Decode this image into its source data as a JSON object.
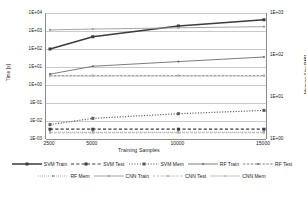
{
  "chart_data": {
    "type": "line",
    "title": "",
    "xlabel": "Training Samples",
    "ylabel": "Time [s]",
    "ylabel_secondary": "Memory Size [MB]",
    "categories": [
      "2500",
      "5000",
      "10000",
      "15000"
    ],
    "x_values": [
      2500,
      5000,
      10000,
      15000
    ],
    "y_axis_left": {
      "scale": "log",
      "ticks": [
        "1E+04",
        "1E+03",
        "1E+02",
        "1E+01",
        "1E+00",
        "1E-01",
        "1E-02",
        "1E-03"
      ],
      "tick_values": [
        10000,
        1000,
        100,
        10,
        1,
        0.1,
        0.01,
        0.001
      ],
      "ylim": [
        0.001,
        10000
      ],
      "unit": "s"
    },
    "y_axis_right": {
      "scale": "log",
      "ticks": [
        "1E+03",
        "1E+02",
        "1E+01",
        "1E+00"
      ],
      "tick_values": [
        1000,
        100,
        10,
        1
      ],
      "ylim": [
        1,
        1000
      ],
      "unit": "MB"
    },
    "grid": true,
    "legend_position": "bottom",
    "series": [
      {
        "name": "SVM Train",
        "axis": "left",
        "unit": "s",
        "values": [
          100,
          480,
          1900,
          4200
        ],
        "color": "#3b3b3b",
        "style": "solid",
        "width": 1.5,
        "marker": "square",
        "marker_size": 3.0
      },
      {
        "name": "SVM Test",
        "axis": "left",
        "unit": "s",
        "values": [
          0.0035,
          0.0035,
          0.0035,
          0.0035
        ],
        "color": "#3b3b3b",
        "style": "dashed",
        "width": 1.2,
        "marker": "square",
        "marker_size": 3.0
      },
      {
        "name": "SVM Mem",
        "axis": "right",
        "unit": "MB",
        "values": [
          2.2,
          3.1,
          4.0,
          4.8
        ],
        "color": "#5a5a5a",
        "style": "dotted",
        "width": 1.2,
        "marker": "square",
        "marker_size": 3.0
      },
      {
        "name": "RF Train",
        "axis": "left",
        "unit": "s",
        "values": [
          4.0,
          11.0,
          20.0,
          36.0
        ],
        "color": "#6e6e6e",
        "style": "solid",
        "width": 0.9,
        "marker": "circle",
        "marker_size": 2.2
      },
      {
        "name": "RF Test",
        "axis": "left",
        "unit": "s",
        "values": [
          3.3,
          3.3,
          3.3,
          3.3
        ],
        "color": "#6e6e6e",
        "style": "dashed",
        "width": 0.9,
        "marker": "circle",
        "marker_size": 2.2
      },
      {
        "name": "RF Mem",
        "axis": "right",
        "unit": "MB",
        "values": [
          1.45,
          1.45,
          1.45,
          1.45
        ],
        "color": "#8a8a8a",
        "style": "dotted",
        "width": 0.9,
        "marker": "circle",
        "marker_size": 2.2
      },
      {
        "name": "CNN Train",
        "axis": "left",
        "unit": "s",
        "values": [
          1150,
          1280,
          1500,
          1750
        ],
        "color": "#9a9a9a",
        "style": "solid",
        "width": 0.9,
        "marker": "circle",
        "marker_size": 2.2
      },
      {
        "name": "CNN Test",
        "axis": "left",
        "unit": "s",
        "values": [
          0.0022,
          0.0022,
          0.0022,
          0.0022
        ],
        "color": "#aeaeae",
        "style": "dashed",
        "width": 0.9,
        "marker": "circle",
        "marker_size": 2.2
      },
      {
        "name": "CNN Mem",
        "axis": "right",
        "unit": "MB",
        "values": [
          31.5,
          31.5,
          31.5,
          31.5
        ],
        "color": "#bdbdbd",
        "style": "solid",
        "width": 0.9,
        "marker": "circle",
        "marker_size": 2.2
      }
    ]
  },
  "legend": {
    "rows": [
      [
        "SVM Train",
        "SVM Test",
        "SVM Mem",
        "RF Train",
        "RF Test"
      ],
      [
        "RF Mem",
        "CNN Train",
        "CNN Test",
        "CNN Mem"
      ]
    ]
  }
}
